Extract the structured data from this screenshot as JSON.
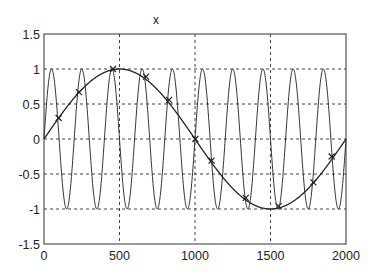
{
  "chart_data": {
    "type": "line",
    "title": "x",
    "xlabel": "",
    "ylabel": "",
    "xlim": [
      0,
      2000
    ],
    "ylim": [
      -1.5,
      1.5
    ],
    "grid": true,
    "legend": null,
    "x_ticks": [
      0,
      500,
      1000,
      1500,
      2000
    ],
    "x_tick_labels": [
      "0",
      "500",
      "1000",
      "1500",
      "2000"
    ],
    "y_ticks": [
      1.5,
      1,
      0.5,
      0,
      -0.5,
      -1,
      -1.5
    ],
    "y_tick_labels": [
      "1.5",
      "1",
      "0.5",
      "0",
      "-0.5",
      "-1",
      "-1.5"
    ],
    "series": [
      {
        "name": "slow sine",
        "style": "solid line",
        "formula": "sin(2*pi*x/2000)",
        "x": [
          0,
          250,
          500,
          750,
          1000,
          1250,
          1500,
          1750,
          2000
        ],
        "values": [
          0,
          0.707,
          1,
          0.707,
          0,
          -0.707,
          -1,
          -0.707,
          0
        ]
      },
      {
        "name": "fast sine",
        "style": "solid line",
        "formula": "sin(2*pi*x/200)",
        "x": [
          0,
          50,
          100,
          150,
          200,
          250,
          300,
          350,
          400
        ],
        "values": [
          0,
          1,
          0,
          -1,
          0,
          1,
          0,
          -1,
          0
        ],
        "note": "period 200, 10 cycles across 0-2000"
      },
      {
        "name": "sample points",
        "style": "x markers",
        "x": [
          97,
          232,
          457,
          676,
          828,
          1002,
          1110,
          1336,
          1554,
          1784,
          1905
        ],
        "values": [
          0.3,
          0.67,
          1.0,
          0.89,
          0.56,
          0.0,
          -0.31,
          -0.84,
          -0.96,
          -0.62,
          -0.25
        ]
      }
    ]
  }
}
